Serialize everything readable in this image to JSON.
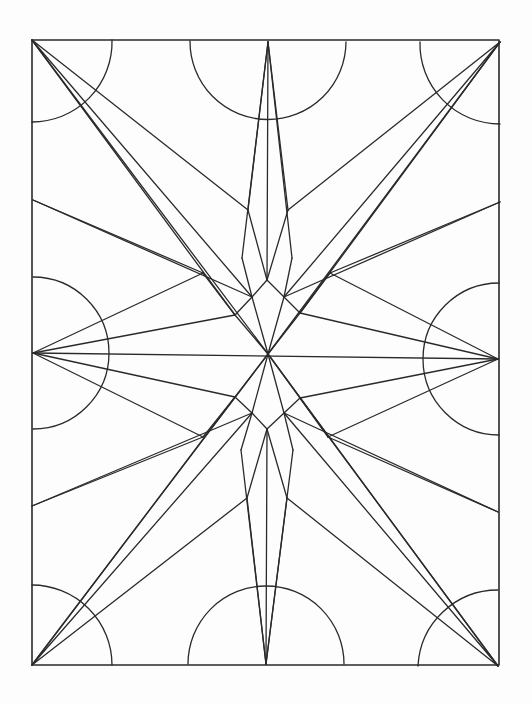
{
  "drawing": {
    "subject": "geometric star coloring page",
    "stroke_color": "#2a2a2a",
    "background": "#fdfdfd",
    "frame": {
      "x": 32,
      "y": 40,
      "width": 467,
      "height": 625
    },
    "arcs": [
      {
        "name": "corner-arc-top-left",
        "d": "M112 40 A80 80 0 0 1 32 122"
      },
      {
        "name": "semicircle-top",
        "d": "M190 41 A78 78 0 0 0 346 42"
      },
      {
        "name": "corner-arc-top-right",
        "d": "M420 42 A80 80 0 0 0 500 124"
      },
      {
        "name": "semicircle-left",
        "d": "M33 277 A76 76 0 0 1 33 429"
      },
      {
        "name": "semicircle-right",
        "d": "M499 283 A76 76 0 0 0 499 435"
      },
      {
        "name": "corner-arc-bottom-left",
        "d": "M32 585 A80 80 0 0 1 112 665"
      },
      {
        "name": "semicircle-bottom",
        "d": "M188 664 A78 78 0 0 1 344 664"
      },
      {
        "name": "corner-arc-bottom-right",
        "d": "M418 666 A80 80 0 0 1 498 590"
      }
    ],
    "lines": [
      [
        268,
        42,
        267,
        280
      ],
      [
        268,
        42,
        248,
        210
      ],
      [
        248,
        210,
        267,
        280
      ],
      [
        268,
        42,
        288,
        210
      ],
      [
        288,
        210,
        267,
        280
      ],
      [
        268,
        42,
        242,
        258
      ],
      [
        242,
        258,
        252,
        297
      ],
      [
        268,
        42,
        292,
        258
      ],
      [
        292,
        258,
        284,
        297
      ],
      [
        266,
        664,
        267,
        429
      ],
      [
        266,
        664,
        247,
        498
      ],
      [
        247,
        498,
        267,
        429
      ],
      [
        266,
        664,
        287,
        498
      ],
      [
        287,
        498,
        267,
        429
      ],
      [
        266,
        664,
        241,
        450
      ],
      [
        241,
        450,
        252,
        413
      ],
      [
        266,
        664,
        293,
        450
      ],
      [
        293,
        450,
        284,
        413
      ],
      [
        33,
        353,
        498,
        359
      ],
      [
        32,
        40,
        268,
        354
      ],
      [
        32,
        40,
        248,
        210
      ],
      [
        32,
        40,
        252,
        297
      ],
      [
        32,
        40,
        235,
        315
      ],
      [
        500,
        42,
        268,
        354
      ],
      [
        500,
        42,
        288,
        210
      ],
      [
        500,
        42,
        284,
        297
      ],
      [
        500,
        42,
        300,
        313
      ],
      [
        32,
        665,
        268,
        354
      ],
      [
        32,
        665,
        247,
        498
      ],
      [
        32,
        665,
        252,
        413
      ],
      [
        32,
        665,
        235,
        397
      ],
      [
        498,
        666,
        268,
        354
      ],
      [
        498,
        666,
        287,
        498
      ],
      [
        498,
        666,
        284,
        413
      ],
      [
        498,
        666,
        300,
        398
      ],
      [
        33,
        200,
        203,
        273
      ],
      [
        203,
        273,
        235,
        315
      ],
      [
        33,
        200,
        252,
        297
      ],
      [
        500,
        202,
        330,
        273
      ],
      [
        330,
        273,
        300,
        313
      ],
      [
        500,
        202,
        284,
        297
      ],
      [
        32,
        506,
        203,
        437
      ],
      [
        203,
        437,
        235,
        397
      ],
      [
        32,
        506,
        252,
        413
      ],
      [
        498,
        512,
        328,
        437
      ],
      [
        328,
        437,
        300,
        398
      ],
      [
        498,
        512,
        284,
        413
      ],
      [
        33,
        353,
        235,
        315
      ],
      [
        33,
        353,
        203,
        273
      ],
      [
        33,
        353,
        235,
        397
      ],
      [
        33,
        353,
        203,
        437
      ],
      [
        498,
        359,
        300,
        313
      ],
      [
        498,
        359,
        330,
        273
      ],
      [
        498,
        359,
        300,
        398
      ],
      [
        498,
        359,
        328,
        437
      ],
      [
        267,
        280,
        252,
        297
      ],
      [
        252,
        297,
        235,
        315
      ],
      [
        235,
        315,
        268,
        354
      ],
      [
        267,
        280,
        284,
        297
      ],
      [
        284,
        297,
        300,
        313
      ],
      [
        300,
        313,
        268,
        354
      ],
      [
        267,
        429,
        252,
        413
      ],
      [
        252,
        413,
        235,
        397
      ],
      [
        235,
        397,
        268,
        354
      ],
      [
        267,
        429,
        284,
        413
      ],
      [
        284,
        413,
        300,
        398
      ],
      [
        300,
        398,
        268,
        354
      ],
      [
        252,
        297,
        268,
        354
      ],
      [
        284,
        297,
        268,
        354
      ],
      [
        252,
        413,
        268,
        354
      ],
      [
        284,
        413,
        268,
        354
      ]
    ]
  }
}
